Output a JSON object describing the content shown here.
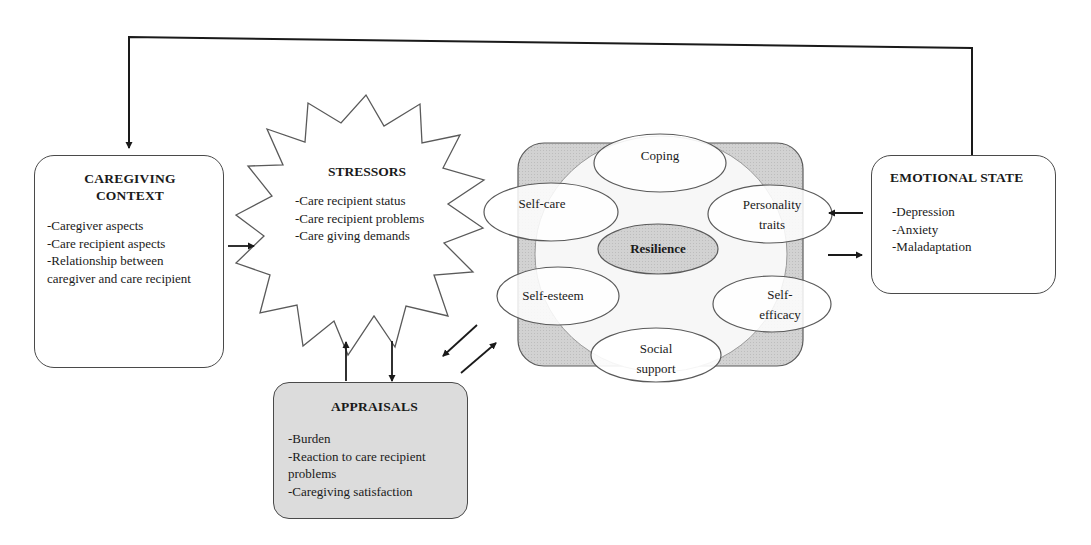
{
  "diagram": {
    "type": "caregiver-stress-resilience-model",
    "colors": {
      "stroke": "#4a4a4a",
      "resilience_backing": "#c9c9c9",
      "resilience_core": "#c4c4c4",
      "appraisals_fill": "#dcdcdc",
      "default_fill": "#ffffff"
    }
  },
  "caregiving_context": {
    "title_line1": "CAREGIVING",
    "title_line2": "CONTEXT",
    "items": [
      "-Caregiver aspects",
      "-Care recipient aspects",
      "-Relationship between caregiver and care recipient"
    ]
  },
  "stressors": {
    "title": "STRESSORS",
    "items": [
      "-Care recipient status",
      "-Care recipient problems",
      "-Care giving demands"
    ]
  },
  "appraisals": {
    "title": "APPRAISALS",
    "items": [
      "-Burden",
      "-Reaction to care recipient problems",
      "-Caregiving satisfaction"
    ]
  },
  "resilience": {
    "core": "Resilience",
    "factors": [
      {
        "id": "coping",
        "label_line1": "Coping",
        "label_line2": ""
      },
      {
        "id": "personality-traits",
        "label_line1": "Personality",
        "label_line2": "traits"
      },
      {
        "id": "self-efficacy",
        "label_line1": "Self-",
        "label_line2": "efficacy"
      },
      {
        "id": "social-support",
        "label_line1": "Social",
        "label_line2": "support"
      },
      {
        "id": "self-esteem",
        "label_line1": "Self-esteem",
        "label_line2": ""
      },
      {
        "id": "self-care",
        "label_line1": "Self-care",
        "label_line2": ""
      }
    ]
  },
  "emotional_state": {
    "title": "EMOTIONAL STATE",
    "items": [
      "-Depression",
      "-Anxiety",
      "-Maladaptation"
    ]
  },
  "connections": [
    {
      "from": "emotional_state",
      "to": "caregiving_context",
      "kind": "feedback-loop"
    },
    {
      "from": "caregiving_context",
      "to": "stressors",
      "kind": "arrow"
    },
    {
      "from": "appraisals",
      "to": "stressors",
      "kind": "arrow"
    },
    {
      "from": "stressors",
      "to": "appraisals",
      "kind": "arrow"
    },
    {
      "from": "resilience",
      "to": "appraisals",
      "kind": "arrow"
    },
    {
      "from": "appraisals",
      "to": "resilience",
      "kind": "arrow"
    },
    {
      "from": "emotional_state",
      "to": "resilience",
      "kind": "arrow"
    },
    {
      "from": "resilience",
      "to": "emotional_state",
      "kind": "arrow"
    }
  ]
}
